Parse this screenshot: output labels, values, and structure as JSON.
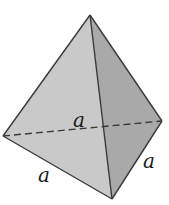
{
  "figure": {
    "shape": "tetrahedron",
    "vertices": {
      "top": [
        90,
        15
      ],
      "left": [
        3,
        136
      ],
      "right": [
        162,
        121
      ],
      "bottom": [
        112,
        199
      ]
    },
    "faces": {
      "left_front": "#c9c9c9",
      "right_front": "#a9a9a9"
    },
    "edge_color": "#3a3a3a",
    "hidden_edge": "left-right (dashed)",
    "labels": {
      "hidden_edge_label": "a",
      "bottom_left_edge_label": "a",
      "bottom_right_edge_label": "a"
    }
  }
}
